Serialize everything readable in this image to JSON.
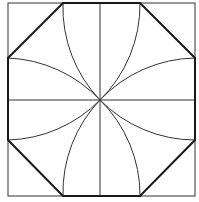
{
  "diagram": {
    "colors": {
      "background": "#ffffff",
      "thin_line": "#333333",
      "thick_line": "#1a1a1a"
    },
    "square": {
      "x": 8,
      "y": 3,
      "size": 187
    },
    "center": {
      "x": 100,
      "y": 100
    },
    "octagon_points": "63,3 140,3 195,58 195,140 140,196 63,196 8,140 8,58",
    "arc_radius": 134
  }
}
